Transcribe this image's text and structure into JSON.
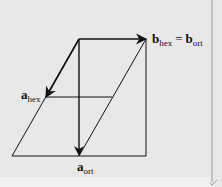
{
  "diagram": {
    "colors": {
      "background": "#e8e8e8",
      "stroke": "#111111",
      "edge_line": "#9a9a9a"
    },
    "labels": {
      "b_vec": {
        "symbol": "b",
        "sub": "hex",
        "eq": "=",
        "symbol2": "b",
        "sub2": "ort"
      },
      "a_hex": {
        "symbol": "a",
        "sub": "hex"
      },
      "a_ort": {
        "symbol": "a",
        "sub": "ort"
      }
    },
    "geometry": {
      "origin": [
        79,
        39
      ],
      "b_tip": [
        146,
        39
      ],
      "a_hex_tip": [
        46,
        97
      ],
      "a_ort_tip": [
        79,
        155
      ],
      "parallelogram": [
        [
          79,
          39
        ],
        [
          146,
          39
        ],
        [
          79,
          156
        ],
        [
          12,
          156
        ]
      ],
      "rectangle": [
        [
          79,
          39
        ],
        [
          146,
          39
        ],
        [
          146,
          156
        ],
        [
          79,
          156
        ]
      ],
      "mid_line": [
        [
          46,
          97
        ],
        [
          112,
          97
        ]
      ]
    }
  }
}
